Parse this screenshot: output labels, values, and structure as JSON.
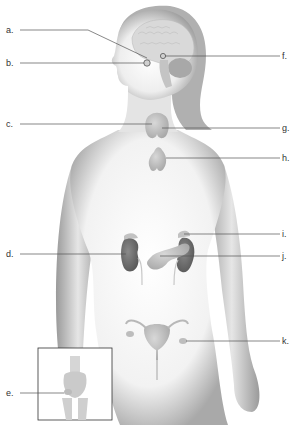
{
  "diagram": {
    "colors": {
      "skin_shadow": "#a8a8a8",
      "skin_light": "#f4f4f4",
      "organ_gray": "#b9b9b9",
      "kidney_dark": "#6e6e6e",
      "leader_line": "#555555",
      "label_text": "#333333"
    },
    "labels": {
      "left": [
        {
          "id": "a",
          "text": "a.",
          "y": 30
        },
        {
          "id": "b",
          "text": "b.",
          "y": 62
        },
        {
          "id": "c",
          "text": "c.",
          "y": 124
        },
        {
          "id": "d",
          "text": "d.",
          "y": 253
        },
        {
          "id": "e",
          "text": "e.",
          "y": 393
        }
      ],
      "right": [
        {
          "id": "f",
          "text": "f.",
          "y": 56
        },
        {
          "id": "g",
          "text": "g.",
          "y": 128
        },
        {
          "id": "h",
          "text": "h.",
          "y": 158
        },
        {
          "id": "i",
          "text": "i.",
          "y": 234
        },
        {
          "id": "j",
          "text": "j.",
          "y": 256
        },
        {
          "id": "k",
          "text": "k.",
          "y": 341
        }
      ]
    }
  }
}
